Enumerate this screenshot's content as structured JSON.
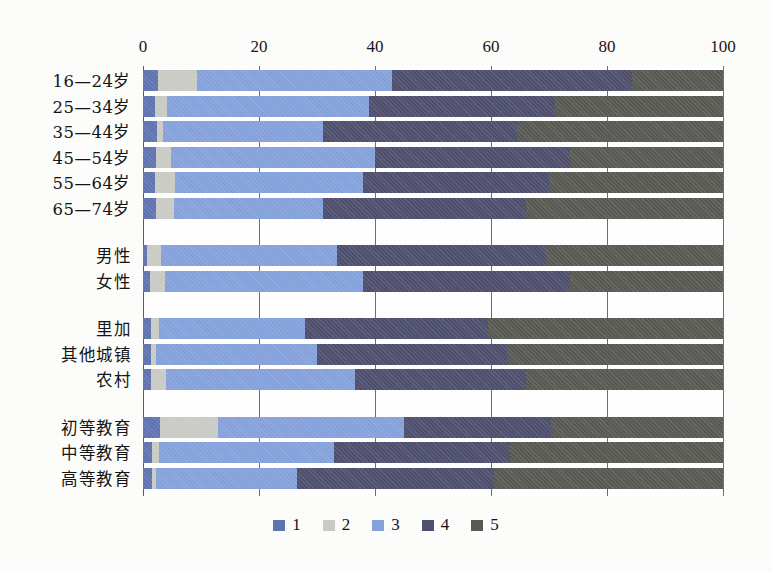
{
  "chart_data": {
    "type": "bar",
    "orientation": "horizontal",
    "stacked": true,
    "stacked_100": true,
    "title": "",
    "subtitle": "",
    "xlabel": "",
    "ylabel": "",
    "xlim": [
      0,
      100
    ],
    "xticks": [
      0,
      20,
      40,
      60,
      80,
      100
    ],
    "xtick_labels": [
      "0",
      "20",
      "40",
      "60",
      "80",
      "100"
    ],
    "grid": true,
    "grid_axis": "x",
    "legend_position": "bottom",
    "legend": [
      "1",
      "2",
      "3",
      "4",
      "5"
    ],
    "series": [
      {
        "name": "1",
        "color": "#5f74b1",
        "values": [
          2.6,
          2.1,
          2.4,
          2.2,
          2.0,
          2.2,
          0.7,
          1.2,
          1.4,
          1.3,
          1.4,
          2.9,
          1.6,
          1.5
        ]
      },
      {
        "name": "2",
        "color": "#cbcbc6",
        "values": [
          6.7,
          2.1,
          1.0,
          2.6,
          3.6,
          3.1,
          2.4,
          2.6,
          1.3,
          1.0,
          2.6,
          10.1,
          1.1,
          0.8
        ]
      },
      {
        "name": "3",
        "color": "#86a2dd",
        "values": [
          33.7,
          34.8,
          27.7,
          35.2,
          32.4,
          25.7,
          30.3,
          34.2,
          25.3,
          27.7,
          32.5,
          32.0,
          30.3,
          24.2
        ]
      },
      {
        "name": "4",
        "color": "#4f4f6e",
        "values": [
          41.3,
          32.0,
          33.4,
          33.7,
          32.0,
          35.0,
          35.9,
          35.6,
          31.5,
          32.7,
          29.5,
          25.3,
          30.3,
          34.1
        ]
      },
      {
        "name": "5",
        "color": "#585a53",
        "values": [
          15.7,
          29.0,
          35.5,
          26.3,
          30.0,
          34.0,
          30.7,
          26.4,
          40.5,
          37.3,
          34.0,
          29.7,
          36.7,
          39.0
        ]
      }
    ],
    "categories": [
      "16—24岁",
      "25—34岁",
      "35—44岁",
      "45—54岁",
      "55—64岁",
      "65—74岁",
      "男性",
      "女性",
      "里加",
      "其他城镇",
      "农村",
      "初等教育",
      "中等教育",
      "高等教育"
    ],
    "category_groups": [
      {
        "name": "age",
        "labels": [
          "16—24岁",
          "25—34岁",
          "35—44岁",
          "45—54岁",
          "55—64岁",
          "65—74岁"
        ]
      },
      {
        "name": "gender",
        "labels": [
          "男性",
          "女性"
        ]
      },
      {
        "name": "settlement",
        "labels": [
          "里加",
          "其他城镇",
          "农村"
        ]
      },
      {
        "name": "education",
        "labels": [
          "初等教育",
          "中等教育",
          "高等教育"
        ]
      }
    ],
    "cumulative_boundaries": [
      [
        2.6,
        9.3,
        43.0,
        84.3,
        100
      ],
      [
        2.1,
        4.2,
        39.0,
        71.0,
        100
      ],
      [
        2.4,
        3.4,
        31.1,
        64.5,
        100
      ],
      [
        2.2,
        4.8,
        40.0,
        73.7,
        100
      ],
      [
        2.0,
        5.6,
        38.0,
        70.0,
        100
      ],
      [
        2.2,
        5.3,
        31.0,
        66.0,
        100
      ],
      [
        0.7,
        3.1,
        33.4,
        69.3,
        100
      ],
      [
        1.2,
        3.8,
        38.0,
        73.6,
        100
      ],
      [
        1.4,
        2.7,
        28.0,
        59.5,
        100
      ],
      [
        1.3,
        2.3,
        30.0,
        62.7,
        100
      ],
      [
        1.4,
        4.0,
        36.5,
        66.0,
        100
      ],
      [
        2.9,
        13.0,
        45.0,
        70.3,
        100
      ],
      [
        1.6,
        2.7,
        33.0,
        63.3,
        100
      ],
      [
        1.5,
        2.3,
        26.5,
        60.6,
        100
      ]
    ]
  },
  "colors": {
    "series1": "#5f74b1",
    "series2": "#cbcbc6",
    "series3": "#86a2dd",
    "series4": "#4f4f6e",
    "series5": "#585a53",
    "background": "#fdfdfb",
    "axis": "#5c5c5c",
    "grid": "#6f6f6f",
    "text": "#141414"
  }
}
